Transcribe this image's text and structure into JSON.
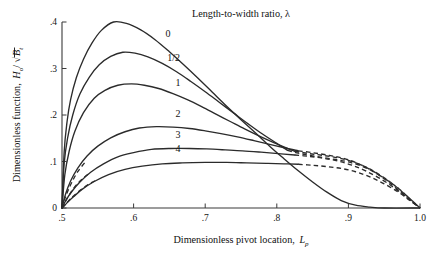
{
  "chart_data": {
    "type": "line",
    "title": "Length-to-width ratio, λ",
    "xlabel": "Dimensionless pivot location, L",
    "xlabel_sub": "p",
    "ylabel": "Dimensionless function, H",
    "ylabel_sub": "o",
    "ylabel_tail": "/ √B",
    "ylabel_tail_sub": "t",
    "xlim": [
      0.5,
      1.0
    ],
    "ylim": [
      0.0,
      0.4
    ],
    "grid": false,
    "legend_position": "inline-curve-labels",
    "xticks": [
      0.5,
      0.6,
      0.7,
      0.8,
      0.9,
      1.0
    ],
    "xticklabels": [
      ".5",
      ".6",
      ".7",
      ".8",
      ".9",
      "1.0"
    ],
    "yticks": [
      0.0,
      0.1,
      0.2,
      0.3,
      0.4
    ],
    "yticklabels": [
      "0",
      ".1",
      ".2",
      ".3",
      ".4"
    ],
    "series": [
      {
        "name": "0",
        "label": "0",
        "label_x": 0.648,
        "label_y": 0.368,
        "peak_x": 0.572,
        "peak_y": 0.4,
        "solid_points": [
          [
            0.5,
            0.0
          ],
          [
            0.503,
            0.12
          ],
          [
            0.507,
            0.185
          ],
          [
            0.512,
            0.233
          ],
          [
            0.52,
            0.28
          ],
          [
            0.53,
            0.32
          ],
          [
            0.542,
            0.355
          ],
          [
            0.555,
            0.382
          ],
          [
            0.572,
            0.4
          ],
          [
            0.59,
            0.397
          ],
          [
            0.61,
            0.383
          ],
          [
            0.63,
            0.362
          ],
          [
            0.65,
            0.336
          ],
          [
            0.67,
            0.308
          ],
          [
            0.69,
            0.279
          ],
          [
            0.71,
            0.249
          ],
          [
            0.73,
            0.219
          ],
          [
            0.75,
            0.19
          ],
          [
            0.77,
            0.162
          ],
          [
            0.79,
            0.133
          ],
          [
            0.81,
            0.106
          ],
          [
            0.83,
            0.08
          ],
          [
            0.85,
            0.056
          ],
          [
            0.87,
            0.034
          ],
          [
            0.89,
            0.016
          ],
          [
            0.91,
            0.006
          ],
          [
            0.93,
            0.002
          ],
          [
            0.95,
            0.0
          ],
          [
            1.0,
            0.0
          ]
        ],
        "dashed_points": []
      },
      {
        "name": "1/2",
        "label": "1/2",
        "label_x": 0.656,
        "label_y": 0.316,
        "peak_x": 0.585,
        "peak_y": 0.335,
        "solid_points": [
          [
            0.5,
            0.0
          ],
          [
            0.503,
            0.095
          ],
          [
            0.508,
            0.152
          ],
          [
            0.515,
            0.2
          ],
          [
            0.525,
            0.245
          ],
          [
            0.538,
            0.281
          ],
          [
            0.552,
            0.308
          ],
          [
            0.568,
            0.326
          ],
          [
            0.585,
            0.335
          ],
          [
            0.602,
            0.333
          ],
          [
            0.62,
            0.325
          ],
          [
            0.64,
            0.311
          ],
          [
            0.66,
            0.293
          ],
          [
            0.68,
            0.272
          ],
          [
            0.7,
            0.25
          ],
          [
            0.72,
            0.227
          ],
          [
            0.74,
            0.204
          ],
          [
            0.76,
            0.181
          ],
          [
            0.78,
            0.159
          ],
          [
            0.8,
            0.139
          ],
          [
            0.815,
            0.124
          ]
        ],
        "dashed_points": [
          [
            0.815,
            0.124
          ],
          [
            0.83,
            0.118
          ],
          [
            0.85,
            0.112
          ],
          [
            0.875,
            0.106
          ],
          [
            0.9,
            0.099
          ],
          [
            0.925,
            0.086
          ],
          [
            0.945,
            0.068
          ],
          [
            0.965,
            0.045
          ],
          [
            0.982,
            0.022
          ],
          [
            1.0,
            0.0
          ]
        ]
      },
      {
        "name": "1",
        "label": "1",
        "label_x": 0.662,
        "label_y": 0.262,
        "peak_x": 0.597,
        "peak_y": 0.267,
        "solid_points": [
          [
            0.5,
            0.0
          ],
          [
            0.504,
            0.072
          ],
          [
            0.51,
            0.122
          ],
          [
            0.518,
            0.165
          ],
          [
            0.53,
            0.205
          ],
          [
            0.545,
            0.236
          ],
          [
            0.56,
            0.253
          ],
          [
            0.578,
            0.264
          ],
          [
            0.597,
            0.267
          ],
          [
            0.615,
            0.264
          ],
          [
            0.635,
            0.257
          ],
          [
            0.655,
            0.246
          ],
          [
            0.675,
            0.233
          ],
          [
            0.695,
            0.218
          ],
          [
            0.715,
            0.202
          ],
          [
            0.735,
            0.186
          ],
          [
            0.755,
            0.17
          ],
          [
            0.775,
            0.155
          ],
          [
            0.795,
            0.141
          ],
          [
            0.815,
            0.128
          ],
          [
            0.825,
            0.122
          ]
        ],
        "dashed_points": [
          [
            0.825,
            0.122
          ],
          [
            0.845,
            0.117
          ],
          [
            0.865,
            0.113
          ],
          [
            0.885,
            0.108
          ],
          [
            0.905,
            0.1
          ],
          [
            0.925,
            0.088
          ],
          [
            0.945,
            0.07
          ],
          [
            0.965,
            0.048
          ],
          [
            0.983,
            0.024
          ],
          [
            1.0,
            0.0
          ]
        ]
      },
      {
        "name": "2",
        "label": "2",
        "label_x": 0.662,
        "label_y": 0.196,
        "peak_x": 0.632,
        "peak_y": 0.175,
        "solid_points": [
          [
            0.5,
            0.0
          ],
          [
            0.505,
            0.03
          ],
          [
            0.512,
            0.058
          ],
          [
            0.522,
            0.086
          ],
          [
            0.535,
            0.112
          ],
          [
            0.55,
            0.133
          ],
          [
            0.568,
            0.151
          ],
          [
            0.588,
            0.164
          ],
          [
            0.608,
            0.172
          ],
          [
            0.632,
            0.175
          ],
          [
            0.655,
            0.174
          ],
          [
            0.678,
            0.171
          ],
          [
            0.7,
            0.166
          ],
          [
            0.722,
            0.16
          ],
          [
            0.745,
            0.153
          ],
          [
            0.768,
            0.145
          ],
          [
            0.79,
            0.137
          ],
          [
            0.812,
            0.129
          ],
          [
            0.83,
            0.123
          ]
        ],
        "dashed_points": [
          [
            0.83,
            0.123
          ],
          [
            0.85,
            0.119
          ],
          [
            0.87,
            0.114
          ],
          [
            0.89,
            0.108
          ],
          [
            0.91,
            0.098
          ],
          [
            0.93,
            0.083
          ],
          [
            0.95,
            0.064
          ],
          [
            0.97,
            0.042
          ],
          [
            0.986,
            0.02
          ],
          [
            1.0,
            0.0
          ]
        ]
      },
      {
        "name": "3",
        "label": "3",
        "label_x": 0.662,
        "label_y": 0.15,
        "peak_x": 0.652,
        "peak_y": 0.128,
        "solid_points": [
          [
            0.5,
            0.0
          ],
          [
            0.506,
            0.018
          ],
          [
            0.514,
            0.036
          ],
          [
            0.525,
            0.056
          ],
          [
            0.54,
            0.077
          ],
          [
            0.558,
            0.095
          ],
          [
            0.578,
            0.11
          ],
          [
            0.6,
            0.119
          ],
          [
            0.625,
            0.126
          ],
          [
            0.652,
            0.128
          ],
          [
            0.678,
            0.128
          ],
          [
            0.702,
            0.127
          ],
          [
            0.728,
            0.125
          ],
          [
            0.752,
            0.123
          ],
          [
            0.778,
            0.12
          ],
          [
            0.802,
            0.117
          ],
          [
            0.825,
            0.114
          ]
        ],
        "dashed_points": [
          [
            0.825,
            0.114
          ],
          [
            0.845,
            0.111
          ],
          [
            0.865,
            0.107
          ],
          [
            0.885,
            0.101
          ],
          [
            0.905,
            0.092
          ],
          [
            0.925,
            0.079
          ],
          [
            0.948,
            0.06
          ],
          [
            0.968,
            0.039
          ],
          [
            0.985,
            0.019
          ],
          [
            1.0,
            0.0
          ]
        ]
      },
      {
        "name": "4",
        "label": "4",
        "label_x": 0.662,
        "label_y": 0.121,
        "peak_x": 0.7,
        "peak_y": 0.098,
        "solid_points": [
          [
            0.5,
            0.0
          ],
          [
            0.507,
            0.011
          ],
          [
            0.516,
            0.024
          ],
          [
            0.528,
            0.04
          ],
          [
            0.545,
            0.057
          ],
          [
            0.565,
            0.072
          ],
          [
            0.588,
            0.083
          ],
          [
            0.612,
            0.09
          ],
          [
            0.64,
            0.095
          ],
          [
            0.668,
            0.097
          ],
          [
            0.7,
            0.098
          ],
          [
            0.73,
            0.098
          ],
          [
            0.758,
            0.097
          ],
          [
            0.785,
            0.096
          ],
          [
            0.81,
            0.095
          ],
          [
            0.83,
            0.094
          ]
        ],
        "dashed_points": [
          [
            0.83,
            0.094
          ],
          [
            0.85,
            0.092
          ],
          [
            0.87,
            0.089
          ],
          [
            0.89,
            0.085
          ],
          [
            0.91,
            0.078
          ],
          [
            0.93,
            0.067
          ],
          [
            0.95,
            0.052
          ],
          [
            0.97,
            0.034
          ],
          [
            0.986,
            0.016
          ],
          [
            1.0,
            0.0
          ]
        ]
      }
    ],
    "leading_dashed_segments": [
      {
        "series": "2",
        "points": [
          [
            0.5,
            0.0
          ],
          [
            0.503,
            0.016
          ],
          [
            0.508,
            0.036
          ],
          [
            0.514,
            0.056
          ],
          [
            0.522,
            0.078
          ],
          [
            0.532,
            0.098
          ]
        ]
      },
      {
        "series": "3",
        "points": [
          [
            0.5,
            0.0
          ],
          [
            0.504,
            0.012
          ],
          [
            0.51,
            0.028
          ],
          [
            0.518,
            0.046
          ],
          [
            0.528,
            0.062
          ],
          [
            0.54,
            0.077
          ]
        ]
      },
      {
        "series": "4",
        "points": [
          [
            0.5,
            0.0
          ],
          [
            0.505,
            0.008
          ],
          [
            0.512,
            0.02
          ],
          [
            0.522,
            0.034
          ],
          [
            0.535,
            0.049
          ],
          [
            0.548,
            0.06
          ]
        ]
      }
    ]
  }
}
